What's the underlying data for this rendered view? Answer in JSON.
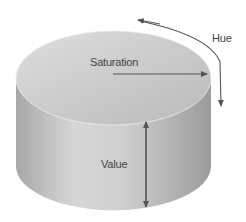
{
  "labels": {
    "hue": "Hue",
    "saturation": "Saturation",
    "value": "Value"
  },
  "colors": {
    "arrow": "#555555",
    "top_face": "#c4c4c4",
    "side_light": "#dadada",
    "side_dark": "#9a9a9a"
  }
}
